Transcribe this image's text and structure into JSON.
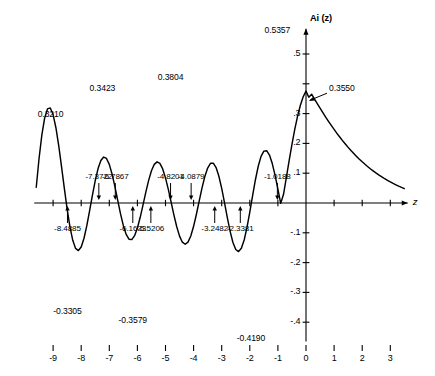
{
  "chart_data": {
    "type": "line",
    "title": "",
    "xlabel": "z",
    "ylabel": "Ai (z)",
    "xlim": [
      -9.6,
      3.6
    ],
    "ylim": [
      -0.48,
      0.6
    ],
    "grid": false,
    "legend": null,
    "function": "Ai(z) — Airy function of the first kind",
    "x_ticks": [
      "-9",
      "-8",
      "-7",
      "-6",
      "-5",
      "-4",
      "-3",
      "-2",
      "-1",
      "0",
      "1",
      "2",
      "3"
    ],
    "x_tick_values": [
      -9,
      -8,
      -7,
      -6,
      -5,
      -4,
      -3,
      -2,
      -1,
      0,
      1,
      2,
      3
    ],
    "y_ticks": [
      ".5",
      "",
      ".3",
      ".2",
      ".1",
      "",
      "-.1",
      "-.2",
      "-.3",
      "-.4"
    ],
    "y_tick_values": [
      0.5,
      0.4,
      0.3,
      0.2,
      0.1,
      0.0,
      -0.1,
      -0.2,
      -0.3,
      -0.4
    ],
    "y_intercept": {
      "x": 0,
      "y": 0.355,
      "label": "0.3550"
    },
    "maxima": [
      {
        "x": -9.02,
        "y": 0.321,
        "label": "0.3210"
      },
      {
        "x": -7.244,
        "y": 0.3423,
        "label": "0.3423"
      },
      {
        "x": -4.82,
        "y": 0.3804,
        "label": "0.3804"
      },
      {
        "x": -1.019,
        "y": 0.5357,
        "label": "0.5357"
      }
    ],
    "minima": [
      {
        "x": -8.488,
        "y": -0.3305,
        "label": "-0.3305"
      },
      {
        "x": -6.163,
        "y": -0.3579,
        "label": "-0.3579"
      },
      {
        "x": -3.248,
        "y": -0.419,
        "label": "-0.4190"
      }
    ],
    "zeros_above_axis": [
      {
        "x": -7.3722,
        "label": "-7.3722"
      },
      {
        "x": -6.7867,
        "label": "-6.7867"
      },
      {
        "x": -4.8201,
        "label": "-4.8201"
      },
      {
        "x": -4.0879,
        "label": "-4.0879"
      },
      {
        "x": -1.0188,
        "label": "-1.0188"
      }
    ],
    "zeros_below_axis": [
      {
        "x": -8.4885,
        "label": "-8.4885"
      },
      {
        "x": -6.1633,
        "label": "-6.1633"
      },
      {
        "x": -5.5206,
        "label": "-5.5206"
      },
      {
        "x": -3.2482,
        "label": "-3.2482"
      },
      {
        "x": -2.3381,
        "label": "-2.3381"
      }
    ],
    "series": [
      {
        "name": "Ai(z)",
        "color": "#000000",
        "points_x": [
          -9.6,
          -9.5,
          -9.4,
          -9.3,
          -9.2,
          -9.1,
          -9.0,
          -8.9,
          -8.8,
          -8.7,
          -8.6,
          -8.5,
          -8.4,
          -8.3,
          -8.2,
          -8.1,
          -8.0,
          -7.9,
          -7.8,
          -7.7,
          -7.6,
          -7.5,
          -7.4,
          -7.3,
          -7.2,
          -7.1,
          -7.0,
          -6.9,
          -6.8,
          -6.7,
          -6.6,
          -6.5,
          -6.4,
          -6.3,
          -6.2,
          -6.1,
          -6.0,
          -5.9,
          -5.8,
          -5.7,
          -5.6,
          -5.5,
          -5.4,
          -5.3,
          -5.2,
          -5.1,
          -5.0,
          -4.9,
          -4.8,
          -4.7,
          -4.6,
          -4.5,
          -4.4,
          -4.3,
          -4.2,
          -4.1,
          -4.0,
          -3.9,
          -3.8,
          -3.7,
          -3.6,
          -3.5,
          -3.4,
          -3.3,
          -3.2,
          -3.1,
          -3.0,
          -2.9,
          -2.8,
          -2.7,
          -2.6,
          -2.5,
          -2.4,
          -2.3,
          -2.2,
          -2.1,
          -2.0,
          -1.9,
          -1.8,
          -1.7,
          -1.6,
          -1.5,
          -1.4,
          -1.3,
          -1.2,
          -1.1,
          -1.0,
          -0.9,
          -0.8,
          -0.7,
          -0.6,
          -0.5,
          -0.4,
          -0.3,
          -0.2,
          -0.1,
          0.0,
          0.1,
          0.2,
          0.3,
          0.4,
          0.5,
          0.6,
          0.7,
          0.8,
          0.9,
          1.0,
          1.1,
          1.2,
          1.3,
          1.4,
          1.5,
          1.6,
          1.7,
          1.8,
          1.9,
          2.0,
          2.1,
          2.2,
          2.3,
          2.4,
          2.5,
          2.6,
          2.7,
          2.8,
          2.9,
          3.0,
          3.1,
          3.2,
          3.3,
          3.4,
          3.5
        ],
        "points_y": [
          0.053,
          0.1493,
          0.2287,
          0.2853,
          0.3157,
          0.319,
          0.2967,
          0.2526,
          0.1923,
          0.1222,
          0.0491,
          -0.0204,
          -0.0802,
          -0.1253,
          -0.1523,
          -0.1596,
          -0.1475,
          -0.1184,
          -0.0761,
          -0.0258,
          0.0266,
          0.0754,
          0.1154,
          0.1425,
          0.1542,
          0.1495,
          0.1295,
          0.0966,
          0.0547,
          0.0085,
          -0.0367,
          -0.0761,
          -0.1053,
          -0.1214,
          -0.1228,
          -0.1097,
          -0.0837,
          -0.048,
          -0.0065,
          0.0362,
          0.0758,
          0.108,
          0.1295,
          0.1381,
          0.1329,
          0.1144,
          0.0843,
          0.0459,
          0.0029,
          -0.0404,
          -0.0798,
          -0.1112,
          -0.1315,
          -0.1385,
          -0.1313,
          -0.1105,
          -0.0782,
          -0.0377,
          0.0068,
          0.0505,
          0.0888,
          0.1174,
          0.1331,
          0.1338,
          0.119,
          0.0898,
          0.0491,
          0.0011,
          -0.0489,
          -0.0952,
          -0.1325,
          -0.1561,
          -0.163,
          -0.1521,
          -0.1241,
          -0.082,
          -0.0303,
          0.0251,
          0.0781,
          0.1233,
          0.1563,
          0.1741,
          0.1755,
          0.1609,
          0.1322,
          0.0928,
          0.0468,
          -0.0012,
          0.0293,
          0.0853,
          0.1418,
          0.1964,
          0.2468,
          0.2913,
          0.3282,
          0.3565,
          0.3755,
          0.355,
          0.3651,
          0.3492,
          0.3335,
          0.3181,
          0.3031,
          0.2884,
          0.2741,
          0.2602,
          0.2468,
          0.2338,
          0.2213,
          0.2093,
          0.1978,
          0.1867,
          0.1761,
          0.166,
          0.1563,
          0.147,
          0.1382,
          0.1298,
          0.1218,
          0.1141,
          0.1069,
          0.1,
          0.0935,
          0.0873,
          0.0814,
          0.0759,
          0.0706,
          0.0656,
          0.0609,
          0.0564,
          0.0522,
          0.0483,
          0.0446,
          0.0411
        ]
      }
    ]
  },
  "axis": {
    "y_axis_label": "Ai (z)",
    "x_axis_label": "z"
  }
}
